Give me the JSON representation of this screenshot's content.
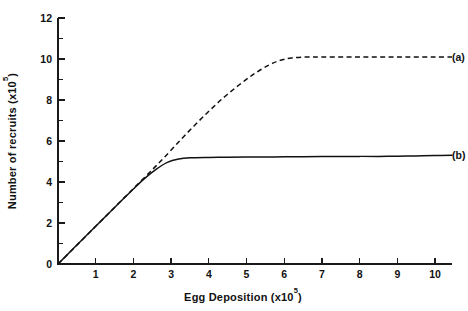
{
  "chart_data": {
    "type": "line",
    "title": "",
    "xlabel": "Egg Deposition (x10",
    "xlabel_exponent": "5",
    "xlabel_suffix": ")",
    "ylabel": "Number of recruits (x10",
    "ylabel_exponent": "5",
    "ylabel_suffix": ")",
    "xlim": [
      0,
      10.45
    ],
    "ylim": [
      0,
      12
    ],
    "grid": false,
    "legend_position": "right-inline",
    "x_ticks_major": [
      1,
      2,
      3,
      4,
      5,
      6,
      7,
      8,
      9,
      10
    ],
    "x_tick_labels": [
      "1",
      "2",
      "3",
      "4",
      "5",
      "6",
      "7",
      "8",
      "9",
      "10"
    ],
    "y_ticks_major": [
      0,
      2,
      4,
      6,
      8,
      10,
      12
    ],
    "y_tick_labels": [
      "0",
      "2",
      "4",
      "6",
      "8",
      "10",
      "12"
    ],
    "y_ticks_minor": [
      1,
      3,
      5,
      7,
      9,
      11
    ],
    "series": [
      {
        "name": "(a)",
        "style": "dashed",
        "label": "(a)",
        "plateau_value": 10.1,
        "knee_x": 2.8,
        "saturation_x": 6.0,
        "x": [
          0,
          0.5,
          1.0,
          1.5,
          2.0,
          2.5,
          2.8,
          3.2,
          3.6,
          4.0,
          4.4,
          4.8,
          5.2,
          5.6,
          5.9,
          6.2,
          6.6,
          7.0,
          7.5,
          8.0,
          8.5,
          9.0,
          9.5,
          10.0,
          10.45
        ],
        "y": [
          0,
          0.92,
          1.84,
          2.76,
          3.68,
          4.6,
          5.16,
          5.95,
          6.72,
          7.45,
          8.13,
          8.73,
          9.27,
          9.71,
          9.94,
          10.05,
          10.1,
          10.1,
          10.1,
          10.1,
          10.1,
          10.1,
          10.1,
          10.1,
          10.1
        ]
      },
      {
        "name": "(b)",
        "style": "solid",
        "label": "(b)",
        "plateau_value": 5.25,
        "knee_x": 2.6,
        "saturation_x": 3.3,
        "x": [
          0,
          0.4,
          0.8,
          1.2,
          1.6,
          2.0,
          2.3,
          2.6,
          2.9,
          3.2,
          3.5,
          4.0,
          4.5,
          5.0,
          5.5,
          6.0,
          6.5,
          7.0,
          7.5,
          8.0,
          8.5,
          9.0,
          9.5,
          10.0,
          10.45
        ],
        "y": [
          0,
          0.74,
          1.48,
          2.21,
          2.94,
          3.66,
          4.18,
          4.62,
          4.96,
          5.12,
          5.18,
          5.2,
          5.21,
          5.22,
          5.22,
          5.23,
          5.23,
          5.24,
          5.24,
          5.25,
          5.25,
          5.26,
          5.27,
          5.29,
          5.3
        ]
      }
    ],
    "annotations": [
      {
        "text": "(a)",
        "x": 10.6,
        "y": 10.1
      },
      {
        "text": "(b)",
        "x": 10.6,
        "y": 5.3
      }
    ]
  }
}
